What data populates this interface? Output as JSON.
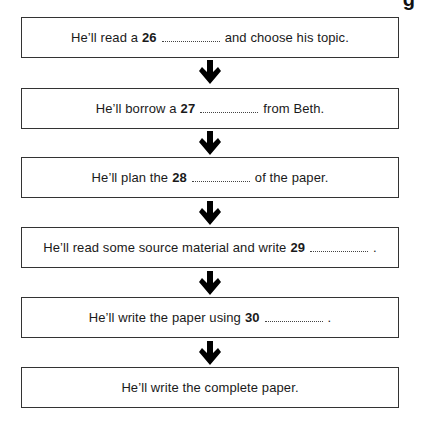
{
  "diagram": {
    "type": "flowchart",
    "heading_fragment": "g",
    "steps": [
      {
        "pre": "He’ll read a",
        "num": "26",
        "post": "and choose his topic."
      },
      {
        "pre": "He’ll borrow a",
        "num": "27",
        "post": "from Beth."
      },
      {
        "pre": "He’ll plan the",
        "num": "28",
        "post": "of the paper."
      },
      {
        "pre": "He’ll read some source material and write",
        "num": "29",
        "post": "."
      },
      {
        "pre": "He’ll write the paper using",
        "num": "30",
        "post": "."
      },
      {
        "pre": "He’ll write the complete paper.",
        "num": "",
        "post": ""
      }
    ],
    "arrow_icon": "down-arrow-icon",
    "colors": {
      "border": "#333333",
      "arrow": "#000000",
      "text": "#1a1a1a"
    }
  }
}
